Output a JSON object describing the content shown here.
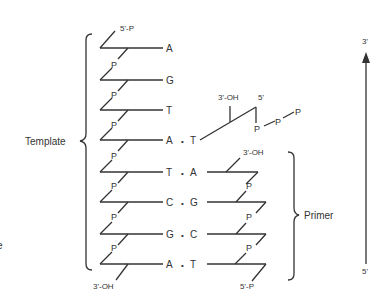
{
  "labels": {
    "template": "Template",
    "primer": "Primer",
    "five_prime_p_top": "5'-P",
    "three_prime_oh_bottom": "3'-OH",
    "incoming_three_prime_oh": "3'-OH",
    "incoming_five_prime": "5'",
    "primer_three_prime_oh": "3'-OH",
    "primer_five_prime_p": "5'-P",
    "axis_top": "3'",
    "axis_bottom": "5'",
    "phosphate": "P",
    "pair_dot": "•",
    "left_edge_fragment": "e"
  },
  "template_bases": [
    "A",
    "G",
    "T",
    "A",
    "T",
    "C",
    "G",
    "A"
  ],
  "pairs": [
    {
      "template": "A",
      "partner": "T"
    },
    {
      "template": "T",
      "partner": "A"
    },
    {
      "template": "C",
      "partner": "G"
    },
    {
      "template": "G",
      "partner": "C"
    },
    {
      "template": "A",
      "partner": "T"
    }
  ],
  "triphosphate": [
    "P",
    "P",
    "P"
  ]
}
